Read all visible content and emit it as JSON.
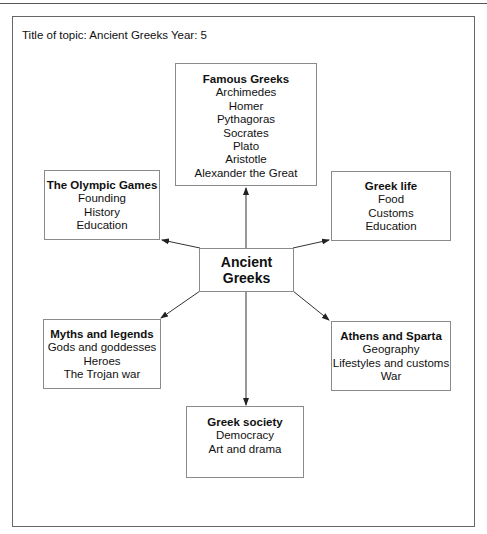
{
  "page": {
    "title": "Title of topic: Ancient Greeks Year: 5"
  },
  "center": {
    "line1": "Ancient",
    "line2": "Greeks"
  },
  "nodes": {
    "famous_greeks": {
      "heading": "Famous Greeks",
      "items": [
        "Archimedes",
        "Homer",
        "Pythagoras",
        "Socrates",
        "Plato",
        "Aristotle",
        "Alexander the Great"
      ]
    },
    "olympic_games": {
      "heading": "The Olympic Games",
      "items": [
        "Founding",
        "History",
        "Education"
      ]
    },
    "greek_life": {
      "heading": "Greek life",
      "items": [
        "Food",
        "Customs",
        "Education"
      ]
    },
    "myths_legends": {
      "heading": "Myths and legends",
      "items": [
        "Gods and goddesses",
        "Heroes",
        "The Trojan war"
      ]
    },
    "athens_sparta": {
      "heading": "Athens and Sparta",
      "items": [
        "Geography",
        "Lifestyles and customs",
        "War"
      ]
    },
    "greek_society": {
      "heading": "Greek society",
      "items": [
        "Democracy",
        "Art and drama"
      ]
    }
  },
  "colors": {
    "line": "#333333",
    "box_border": "#8a8a8a",
    "frame_border": "#666666"
  }
}
